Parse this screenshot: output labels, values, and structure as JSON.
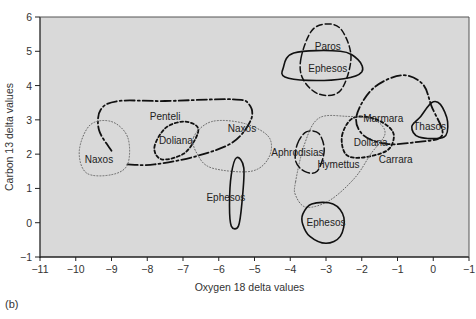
{
  "chart_data": {
    "type": "scatter",
    "title": "",
    "xlabel": "Oxygen 18 delta values",
    "ylabel": "Carbon 13 delta values",
    "xlim": [
      -11,
      1
    ],
    "ylim": [
      -1,
      6
    ],
    "x_ticks": [
      -11,
      -10,
      -9,
      -8,
      -7,
      -6,
      -5,
      -4,
      -3,
      -2,
      -1,
      0,
      1
    ],
    "x_tick_labels": [
      "−11",
      "−10",
      "−9",
      "−8",
      "−7",
      "−6",
      "−5",
      "−4",
      "−3",
      "−2",
      "−1",
      "0",
      "−1"
    ],
    "y_ticks": [
      -1,
      0,
      1,
      2,
      3,
      4,
      5,
      6
    ],
    "y_tick_labels": [
      "−1",
      "0",
      "1",
      "2",
      "3",
      "4",
      "5",
      "6"
    ],
    "grid": false,
    "legend": "none",
    "plot_background": "#d9d9d9",
    "regions": [
      {
        "name": "Penteli",
        "style": "dash-dot",
        "label_at": [
          -7.5,
          3.1
        ],
        "outline": [
          [
            -9.0,
            2.1
          ],
          [
            -9.35,
            2.7
          ],
          [
            -9.3,
            3.3
          ],
          [
            -8.8,
            3.55
          ],
          [
            -7.5,
            3.55
          ],
          [
            -5.6,
            3.6
          ],
          [
            -5.15,
            3.45
          ],
          [
            -5.1,
            3.0
          ],
          [
            -5.6,
            2.35
          ],
          [
            -6.6,
            1.95
          ],
          [
            -7.8,
            1.7
          ],
          [
            -8.6,
            1.7
          ]
        ],
        "closed": false
      },
      {
        "name": "Naxos",
        "style": "dotted",
        "label_at": [
          -9.35,
          1.85
        ],
        "outline": [
          [
            -9.9,
            2.1
          ],
          [
            -9.6,
            2.85
          ],
          [
            -9.0,
            2.95
          ],
          [
            -8.55,
            2.5
          ],
          [
            -8.55,
            1.7
          ],
          [
            -9.0,
            1.4
          ],
          [
            -9.7,
            1.45
          ]
        ],
        "closed": true
      },
      {
        "name": "Doliana",
        "style": "short-dash",
        "label_at": [
          -7.2,
          2.4
        ],
        "outline": [
          [
            -7.8,
            2.2
          ],
          [
            -7.5,
            2.75
          ],
          [
            -7.0,
            2.95
          ],
          [
            -6.6,
            2.8
          ],
          [
            -6.65,
            2.45
          ],
          [
            -7.0,
            2.0
          ],
          [
            -7.6,
            1.85
          ]
        ],
        "closed": true
      },
      {
        "name": "Naxos",
        "style": "dotted",
        "label_at": [
          -5.35,
          2.75
        ],
        "outline": [
          [
            -6.7,
            2.5
          ],
          [
            -6.2,
            2.95
          ],
          [
            -5.3,
            2.9
          ],
          [
            -4.6,
            2.5
          ],
          [
            -4.6,
            1.9
          ],
          [
            -5.1,
            1.5
          ],
          [
            -6.2,
            1.6
          ],
          [
            -6.6,
            2.0
          ]
        ],
        "closed": true
      },
      {
        "name": "Ephesos",
        "style": "solid",
        "label_at": [
          -5.8,
          0.75
        ],
        "outline": [
          [
            -5.5,
            1.9
          ],
          [
            -5.3,
            1.6
          ],
          [
            -5.35,
            0.6
          ],
          [
            -5.45,
            -0.1
          ],
          [
            -5.65,
            -0.1
          ],
          [
            -5.7,
            0.5
          ],
          [
            -5.65,
            1.4
          ]
        ],
        "closed": true
      },
      {
        "name": "Paros",
        "style": "dashed",
        "label_at": [
          -2.95,
          5.15
        ],
        "outline": [
          [
            -3.7,
            4.8
          ],
          [
            -3.4,
            5.6
          ],
          [
            -2.95,
            5.8
          ],
          [
            -2.55,
            5.6
          ],
          [
            -2.3,
            4.8
          ],
          [
            -2.6,
            3.85
          ],
          [
            -3.2,
            3.75
          ],
          [
            -3.65,
            4.2
          ]
        ],
        "closed": true
      },
      {
        "name": "Ephesos",
        "style": "solid",
        "label_at": [
          -2.95,
          4.5
        ],
        "outline": [
          [
            -4.2,
            4.5
          ],
          [
            -3.9,
            4.95
          ],
          [
            -2.6,
            5.0
          ],
          [
            -2.1,
            4.75
          ],
          [
            -2.0,
            4.4
          ],
          [
            -2.5,
            4.2
          ],
          [
            -3.5,
            4.15
          ],
          [
            -4.15,
            4.25
          ]
        ],
        "closed": true
      },
      {
        "name": "Marmara",
        "style": "dash-dot",
        "label_at": [
          -1.4,
          3.05
        ],
        "outline": [
          [
            -2.15,
            3.1
          ],
          [
            -1.7,
            3.9
          ],
          [
            -0.9,
            4.3
          ],
          [
            -0.3,
            4.05
          ],
          [
            -0.05,
            3.4
          ],
          [
            0.25,
            2.55
          ],
          [
            -0.5,
            2.35
          ],
          [
            -1.3,
            2.3
          ],
          [
            -1.95,
            2.55
          ]
        ],
        "closed": true
      },
      {
        "name": "Thasos",
        "style": "solid",
        "label_at": [
          -0.1,
          2.8
        ],
        "outline": [
          [
            -0.6,
            2.8
          ],
          [
            -0.35,
            3.1
          ],
          [
            -0.05,
            3.5
          ],
          [
            0.2,
            3.45
          ],
          [
            0.4,
            2.95
          ],
          [
            0.3,
            2.5
          ],
          [
            -0.4,
            2.5
          ]
        ],
        "closed": true
      },
      {
        "name": "Doliana",
        "style": "short-dash",
        "label_at": [
          -1.75,
          2.35
        ],
        "outline": [
          [
            -2.55,
            2.55
          ],
          [
            -2.25,
            3.05
          ],
          [
            -1.7,
            3.05
          ],
          [
            -1.25,
            2.8
          ],
          [
            -1.1,
            2.5
          ],
          [
            -1.3,
            2.1
          ],
          [
            -2.0,
            1.9
          ],
          [
            -2.45,
            2.0
          ]
        ],
        "closed": true
      },
      {
        "name": "Hymettus",
        "style": "dotted",
        "label_at": [
          -2.65,
          1.7
        ],
        "outline": [
          [
            -3.85,
            1.2
          ],
          [
            -3.6,
            2.3
          ],
          [
            -3.2,
            3.05
          ],
          [
            -2.4,
            3.1
          ],
          [
            -1.65,
            3.0
          ],
          [
            -1.35,
            2.6
          ],
          [
            -1.75,
            2.0
          ],
          [
            -2.2,
            1.3
          ],
          [
            -2.9,
            0.65
          ],
          [
            -3.55,
            0.45
          ],
          [
            -3.85,
            0.8
          ]
        ],
        "closed": true
      },
      {
        "name": "Aphrodisias",
        "style": "long-dash",
        "label_at": [
          -3.8,
          2.05
        ],
        "outline": [
          [
            -3.8,
            2.3
          ],
          [
            -3.55,
            2.65
          ],
          [
            -3.2,
            2.6
          ],
          [
            -3.05,
            2.1
          ],
          [
            -3.25,
            1.5
          ],
          [
            -3.6,
            1.5
          ],
          [
            -3.85,
            1.8
          ]
        ],
        "closed": true
      },
      {
        "name": "Ephesos",
        "style": "solid",
        "label_at": [
          -3.0,
          0.0
        ],
        "outline": [
          [
            -3.65,
            0.25
          ],
          [
            -3.4,
            0.55
          ],
          [
            -2.8,
            0.55
          ],
          [
            -2.5,
            0.15
          ],
          [
            -2.6,
            -0.4
          ],
          [
            -3.0,
            -0.6
          ],
          [
            -3.45,
            -0.4
          ],
          [
            -3.65,
            -0.05
          ]
        ],
        "closed": true
      },
      {
        "name": "Carrara",
        "style": "none",
        "label_at": [
          -1.05,
          1.85
        ],
        "outline": [],
        "closed": true
      }
    ]
  },
  "panel_label": "(b)"
}
